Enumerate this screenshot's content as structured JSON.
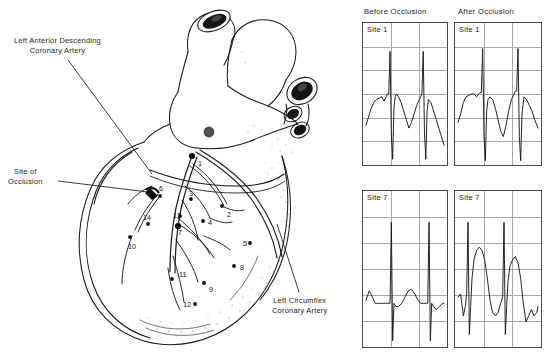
{
  "figure": {
    "background_color": "#ffffff",
    "ink_color": "#1a1a1a",
    "grid_color": "#9a9a9a"
  },
  "heart_diagram": {
    "annotations": [
      {
        "name": "left-anterior-descending",
        "line1": "Left Anterior Descending",
        "line2": "Coronary Artery"
      },
      {
        "name": "site-of-occlusion",
        "line1": "Site of",
        "line2": "Occlusion"
      },
      {
        "name": "left-circumflex",
        "line1": "Left Circumflex",
        "line2": "Coronary Artery"
      }
    ],
    "site_markers": [
      {
        "id": "1",
        "label": "1",
        "x": 198,
        "y": 160,
        "dot_x": 192,
        "dot_y": 156,
        "big": true
      },
      {
        "id": "2",
        "label": "2",
        "x": 227,
        "y": 211,
        "dot_x": 222,
        "dot_y": 206,
        "big": false
      },
      {
        "id": "3",
        "label": "3",
        "x": 189,
        "y": 190,
        "dot_x": 191,
        "dot_y": 199,
        "big": false
      },
      {
        "id": "4",
        "label": "4",
        "x": 208,
        "y": 219,
        "dot_x": 203,
        "dot_y": 221,
        "big": false
      },
      {
        "id": "5",
        "label": "5",
        "x": 243,
        "y": 240,
        "dot_x": 250,
        "dot_y": 243,
        "big": false
      },
      {
        "id": "6",
        "label": "6",
        "x": 159,
        "y": 185,
        "dot_x": 160,
        "dot_y": 196,
        "big": false
      },
      {
        "id": "7",
        "label": "7",
        "x": 178,
        "y": 229,
        "dot_x": 178,
        "dot_y": 226,
        "big": true
      },
      {
        "id": "8",
        "label": "8",
        "x": 240,
        "y": 264,
        "dot_x": 234,
        "dot_y": 266,
        "big": false
      },
      {
        "id": "9",
        "label": "9",
        "x": 209,
        "y": 286,
        "dot_x": 204,
        "dot_y": 283,
        "big": false
      },
      {
        "id": "10",
        "label": "10",
        "x": 128,
        "y": 243,
        "dot_x": 130,
        "dot_y": 237,
        "big": false
      },
      {
        "id": "11",
        "label": "11",
        "x": 179,
        "y": 271,
        "dot_x": 172,
        "dot_y": 279,
        "big": false
      },
      {
        "id": "12",
        "label": "12",
        "x": 183,
        "y": 301,
        "dot_x": 195,
        "dot_y": 304,
        "big": false
      },
      {
        "id": "13",
        "label": "13",
        "x": 173,
        "y": 212,
        "dot_x": 180,
        "dot_y": 216,
        "big": false
      },
      {
        "id": "14",
        "label": "14",
        "x": 143,
        "y": 214,
        "dot_x": 148,
        "dot_y": 224,
        "big": false
      }
    ]
  },
  "ecg": {
    "column_headers": {
      "before": "Before Occlusion",
      "after": "After Occlusion"
    },
    "panels": [
      {
        "key": "before_site1",
        "label": "Site 1",
        "column": "before",
        "row": "site1"
      },
      {
        "key": "after_site1",
        "label": "Site 1",
        "column": "after",
        "row": "site1"
      },
      {
        "key": "before_site7",
        "label": "Site 7",
        "column": "before",
        "row": "site7"
      },
      {
        "key": "after_site7",
        "label": "Site 7",
        "column": "after",
        "row": "site7"
      }
    ],
    "grid": {
      "columns": 3,
      "rows": 6,
      "line_color": "#9c9c9c"
    }
  },
  "chart_data": {
    "type": "line",
    "xlabel": "",
    "ylabel": "",
    "grid": true,
    "legend": "none",
    "panels": [
      {
        "name": "before_site1",
        "label": "Site 1",
        "condition": "Before Occlusion",
        "site": 1,
        "description": "Normal electrogram: sharp biphasic QRS complexes with near-isoelectric baseline and sloping repolarization ramp between beats.",
        "beats": 2,
        "st_elevation": "none",
        "x": [
          0,
          4,
          8,
          12,
          16,
          20,
          24,
          28,
          31,
          33,
          35,
          37,
          39,
          41,
          43,
          45,
          47,
          50,
          54,
          58,
          62,
          66,
          70,
          74,
          78,
          82,
          84,
          86,
          88,
          90,
          92,
          94,
          96,
          100,
          104,
          108,
          112,
          116,
          120
        ],
        "y": [
          72,
          66,
          60,
          56,
          54,
          53,
          52,
          55,
          52,
          50,
          50,
          20,
          78,
          96,
          60,
          52,
          50,
          52,
          56,
          62,
          68,
          74,
          70,
          64,
          58,
          54,
          52,
          50,
          20,
          78,
          96,
          62,
          54,
          56,
          62,
          68,
          74,
          80,
          86
        ]
      },
      {
        "name": "after_site1",
        "label": "Site 1",
        "condition": "After Occlusion",
        "site": 1,
        "description": "Mild change: QRS preserved, slight ST shift with a shallower descending limb between beats.",
        "beats": 2,
        "st_elevation": "mild",
        "x": [
          0,
          4,
          8,
          12,
          16,
          20,
          24,
          28,
          31,
          33,
          35,
          37,
          39,
          41,
          43,
          45,
          48,
          52,
          56,
          60,
          64,
          68,
          72,
          76,
          80,
          84,
          86,
          88,
          90,
          92,
          94,
          96,
          99,
          103,
          107,
          111,
          115,
          120
        ],
        "y": [
          70,
          64,
          56,
          52,
          51,
          50,
          50,
          52,
          50,
          49,
          49,
          18,
          80,
          97,
          62,
          54,
          52,
          54,
          60,
          68,
          76,
          80,
          72,
          62,
          54,
          50,
          48,
          48,
          18,
          80,
          97,
          64,
          52,
          54,
          58,
          62,
          68,
          74
        ]
      },
      {
        "name": "before_site7",
        "label": "Site 7",
        "condition": "Before Occlusion",
        "site": 7,
        "description": "Normal electrogram: tall narrow spikes with a flat, isoelectric ST segment and small smooth T wave.",
        "beats": 2,
        "st_elevation": "none",
        "x": [
          0,
          5,
          10,
          14,
          18,
          22,
          26,
          30,
          33,
          35,
          37,
          39,
          41,
          43,
          46,
          50,
          55,
          60,
          65,
          70,
          75,
          80,
          84,
          88,
          91,
          93,
          95,
          97,
          99,
          101,
          104,
          108,
          113,
          118,
          120
        ],
        "y": [
          70,
          64,
          68,
          72,
          72,
          72,
          72,
          72,
          72,
          72,
          72,
          20,
          96,
          72,
          74,
          74,
          72,
          68,
          64,
          63,
          66,
          70,
          72,
          72,
          72,
          72,
          72,
          20,
          96,
          72,
          74,
          76,
          74,
          72,
          72
        ]
      },
      {
        "name": "after_site7",
        "label": "Site 7",
        "condition": "After Occlusion",
        "site": 7,
        "description": "Marked injury current: pronounced dome-shaped ST-segment elevation immediately following each QRS, returning toward baseline before the next beat.",
        "beats": 2,
        "st_elevation": "marked",
        "x": [
          0,
          4,
          8,
          11,
          13,
          15,
          17,
          19,
          21,
          24,
          28,
          32,
          36,
          40,
          44,
          48,
          52,
          56,
          60,
          64,
          67,
          69,
          71,
          73,
          75,
          78,
          82,
          86,
          90,
          94,
          98,
          102,
          106,
          110,
          114,
          118,
          120
        ],
        "y": [
          68,
          66,
          80,
          74,
          66,
          20,
          92,
          74,
          56,
          44,
          38,
          36,
          38,
          44,
          56,
          70,
          78,
          80,
          78,
          72,
          68,
          20,
          92,
          74,
          58,
          48,
          44,
          42,
          46,
          56,
          72,
          84,
          80,
          76,
          80,
          78,
          74
        ]
      }
    ]
  }
}
